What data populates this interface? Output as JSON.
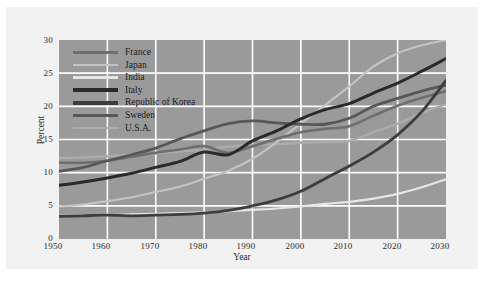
{
  "chart_data": {
    "type": "line",
    "title": "",
    "xlabel": "Year",
    "ylabel": "Percent",
    "xlim": [
      1950,
      2030
    ],
    "ylim": [
      0,
      30
    ],
    "xticks": [
      1950,
      1960,
      1970,
      1980,
      1990,
      2000,
      2010,
      2020,
      2030
    ],
    "yticks": [
      0,
      5,
      10,
      15,
      20,
      25,
      30
    ],
    "grid": true,
    "legend_position": "upper-left-inside",
    "x": [
      1950,
      1955,
      1960,
      1965,
      1970,
      1975,
      1980,
      1985,
      1990,
      1995,
      2000,
      2005,
      2010,
      2015,
      2020,
      2025,
      2030
    ],
    "series": [
      {
        "name": "France",
        "color": "#6e6e6e",
        "width": 2.6,
        "values": [
          11.5,
          11.5,
          11.8,
          12.4,
          13.0,
          13.5,
          14.0,
          13.0,
          14.0,
          15.1,
          16.1,
          16.6,
          17.0,
          18.6,
          20.1,
          21.3,
          22.3
        ]
      },
      {
        "name": "Japan",
        "color": "#c3c3c3",
        "width": 2.2,
        "values": [
          4.9,
          5.2,
          5.7,
          6.3,
          7.1,
          7.9,
          9.1,
          10.3,
          12.1,
          14.6,
          17.4,
          20.2,
          23.0,
          26.0,
          28.0,
          29.2,
          30.0
        ]
      },
      {
        "name": "India",
        "color": "#e6e6e6",
        "width": 2.2,
        "values": [
          3.5,
          3.5,
          3.6,
          3.7,
          3.8,
          3.9,
          4.0,
          4.2,
          4.4,
          4.6,
          4.9,
          5.3,
          5.6,
          6.1,
          6.8,
          7.8,
          9.0
        ]
      },
      {
        "name": "Italy",
        "color": "#2a2a2a",
        "width": 3.0,
        "values": [
          8.1,
          8.6,
          9.2,
          9.9,
          10.8,
          11.7,
          13.1,
          12.7,
          14.8,
          16.3,
          18.1,
          19.5,
          20.4,
          22.0,
          23.5,
          25.3,
          27.2
        ]
      },
      {
        "name": "Republic of Korea",
        "color": "#3d3d3d",
        "width": 2.8,
        "values": [
          3.4,
          3.5,
          3.6,
          3.5,
          3.6,
          3.7,
          3.9,
          4.3,
          5.0,
          5.9,
          7.2,
          9.1,
          11.0,
          13.1,
          15.7,
          19.2,
          23.9
        ]
      },
      {
        "name": "Sweden",
        "color": "#575757",
        "width": 2.8,
        "values": [
          10.2,
          10.8,
          11.8,
          12.7,
          13.7,
          15.1,
          16.3,
          17.4,
          17.8,
          17.5,
          17.3,
          17.3,
          18.2,
          20.0,
          21.2,
          22.3,
          23.2
        ]
      },
      {
        "name": "U.S.A.",
        "color": "#ababab",
        "width": 2.4,
        "values": [
          12.2,
          12.3,
          12.5,
          12.7,
          12.9,
          13.2,
          13.5,
          13.9,
          14.2,
          14.3,
          14.5,
          14.6,
          14.8,
          16.1,
          17.4,
          19.0,
          20.3
        ]
      }
    ]
  },
  "axes": {
    "y_label": "Percent",
    "x_label": "Year",
    "y_ticks": [
      "0",
      "5",
      "10",
      "15",
      "20",
      "25",
      "30"
    ],
    "x_ticks": [
      "1950",
      "1960",
      "1970",
      "1980",
      "1990",
      "2000",
      "2010",
      "2020",
      "2030"
    ]
  },
  "legend": {
    "items": [
      {
        "label": "France",
        "color": "#6e6e6e",
        "weight": "normal"
      },
      {
        "label": "Japan",
        "color": "#c3c3c3",
        "weight": "thin"
      },
      {
        "label": "India",
        "color": "#e6e6e6",
        "weight": "thin"
      },
      {
        "label": "Italy",
        "color": "#2a2a2a",
        "weight": "thick"
      },
      {
        "label": "Republic of Korea",
        "color": "#3d3d3d",
        "weight": "thick"
      },
      {
        "label": "Sweden",
        "color": "#575757",
        "weight": "normal"
      },
      {
        "label": "U.S.A.",
        "color": "#ababab",
        "weight": "thin"
      }
    ]
  },
  "style": {
    "plot_background": "#9a9a9a",
    "grid_color": "#ffffff",
    "page_background": "#f2f2f2",
    "outer_background": "#ffffff",
    "text_color": "#2b2b2b"
  }
}
